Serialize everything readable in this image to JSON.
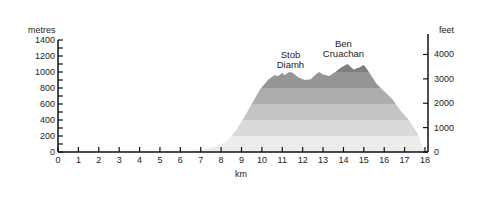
{
  "chart_data": {
    "type": "area",
    "title": "",
    "xlabel": "km",
    "ylabel": "metres",
    "y2label": "feet",
    "xlim": [
      0,
      18
    ],
    "ylim": [
      0,
      1400
    ],
    "y2lim": [
      0,
      4593
    ],
    "x_ticks": [
      0,
      1,
      2,
      3,
      4,
      5,
      6,
      7,
      8,
      9,
      10,
      11,
      12,
      13,
      14,
      15,
      16,
      17,
      18
    ],
    "y_ticks": [
      0,
      200,
      400,
      600,
      800,
      1000,
      1200,
      1400
    ],
    "y_minor_step": 100,
    "y2_ticks": [
      0,
      1000,
      2000,
      3000,
      4000
    ],
    "grid": false,
    "band_step_m": 200,
    "band_colors": [
      "#ececec",
      "#dadada",
      "#c4c4c4",
      "#adadad",
      "#959595",
      "#7f7f7f",
      "#666666"
    ],
    "profile": [
      [
        0,
        0
      ],
      [
        5,
        0
      ],
      [
        6,
        10
      ],
      [
        7,
        30
      ],
      [
        7.8,
        70
      ],
      [
        8.3,
        140
      ],
      [
        8.7,
        260
      ],
      [
        9.1,
        420
      ],
      [
        9.5,
        600
      ],
      [
        9.9,
        780
      ],
      [
        10.3,
        900
      ],
      [
        10.6,
        960
      ],
      [
        10.8,
        950
      ],
      [
        11,
        990
      ],
      [
        11.1,
        960
      ],
      [
        11.35,
        1000
      ],
      [
        11.5,
        990
      ],
      [
        11.8,
        930
      ],
      [
        12.1,
        900
      ],
      [
        12.4,
        910
      ],
      [
        12.6,
        960
      ],
      [
        12.8,
        1000
      ],
      [
        13,
        970
      ],
      [
        13.3,
        950
      ],
      [
        13.6,
        1000
      ],
      [
        13.9,
        1060
      ],
      [
        14.2,
        1100
      ],
      [
        14.5,
        1030
      ],
      [
        14.8,
        1060
      ],
      [
        15,
        1090
      ],
      [
        15.3,
        980
      ],
      [
        15.6,
        860
      ],
      [
        16,
        760
      ],
      [
        16.4,
        660
      ],
      [
        16.8,
        520
      ],
      [
        17.2,
        400
      ],
      [
        17.6,
        250
      ],
      [
        18,
        0
      ]
    ],
    "annotations": [
      {
        "text_lines": [
          "Stob",
          "Diamh"
        ],
        "x_km": 11.4,
        "y_m": 1180
      },
      {
        "text_lines": [
          "Ben",
          "Cruachan"
        ],
        "x_km": 14.0,
        "y_m": 1310
      }
    ]
  }
}
